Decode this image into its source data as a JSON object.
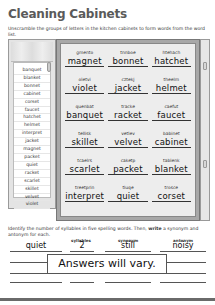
{
  "worksheet": {
    "title": "Cleaning Cabinets",
    "instructions": "Unscramble the groups of letters in the kitchen cabinets to form words from the word list.",
    "word_list": [
      "banquet",
      "blanket",
      "bonnet",
      "cabinet",
      "corset",
      "faucet",
      "hatchet",
      "helmet",
      "interpret",
      "jacket",
      "magnet",
      "packet",
      "quiet",
      "racket",
      "scarlet",
      "skillet",
      "velvet",
      "violet"
    ],
    "cabinet_items": [
      {
        "scrambled": "gmento",
        "answer": "magnet"
      },
      {
        "scrambled": "tnnboe",
        "answer": "bonnet"
      },
      {
        "scrambled": "htehach",
        "answer": "hatchet"
      },
      {
        "scrambled": "oletvi",
        "answer": "violet"
      },
      {
        "scrambled": "cztekj",
        "answer": "jacket"
      },
      {
        "scrambled": "theelm",
        "answer": "helmet"
      },
      {
        "scrambled": "quenbat",
        "answer": "banquet"
      },
      {
        "scrambled": "tracke",
        "answer": "racket"
      },
      {
        "scrambled": "caefut",
        "answer": "faucet"
      },
      {
        "scrambled": "tellisk",
        "answer": "skillet"
      },
      {
        "scrambled": "vetlev",
        "answer": "velvet"
      },
      {
        "scrambled": "babinet",
        "answer": "cabinet"
      },
      {
        "scrambled": "tcaelrs",
        "answer": "scarlet"
      },
      {
        "scrambled": "caketp",
        "answer": "packet"
      },
      {
        "scrambled": "tablenk",
        "answer": "blanket"
      },
      {
        "scrambled": "treetprin",
        "answer": "interpret"
      },
      {
        "scrambled": "tiuqe",
        "answer": "quiet"
      },
      {
        "scrambled": "trosce",
        "answer": "corset"
      }
    ],
    "syllable_prompt_pre": "Identify the number of syllables in five spelling words. Then, ",
    "syllable_prompt_bold": "write",
    "syllable_prompt_post": " a synonym and antonym for each.",
    "table": {
      "headers": {
        "syllables": "syllables",
        "synonym": "synonym",
        "antonym": "antonym"
      },
      "example": {
        "word": "quiet",
        "syllables": "2",
        "synonym": "still",
        "antonym": "noisy"
      }
    },
    "answers_note": "Answers will vary."
  }
}
